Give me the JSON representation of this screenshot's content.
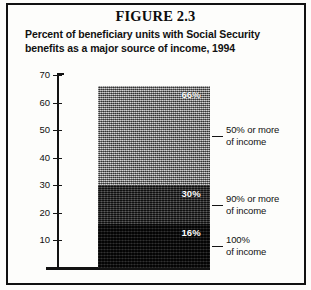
{
  "figure": {
    "number_title": "FIGURE 2.3",
    "subtitle": "Percent of beneficiary units with Social Security benefits as a major source of income, 1994"
  },
  "chart_data": {
    "type": "bar",
    "title": "Percent of beneficiary units with Social Security benefits as a major source of income, 1994",
    "xlabel": "",
    "ylabel": "",
    "ylim": [
      0,
      70
    ],
    "grid": false,
    "legend_position": "right-callouts",
    "stacked": true,
    "categories": [
      "Beneficiary units, 1994"
    ],
    "series": [
      {
        "name": "100% of income",
        "value": 16,
        "data_label": "16%",
        "fill": "darkest"
      },
      {
        "name": "90% or more of income",
        "value": 30,
        "data_label": "30%",
        "fill": "dark"
      },
      {
        "name": "50% or more of income",
        "value": 66,
        "data_label": "66%",
        "fill": "light"
      }
    ],
    "segments": [
      {
        "label": "66%",
        "top_value": 66,
        "bottom_value": 30,
        "callout": "50% or more of income"
      },
      {
        "label": "30%",
        "top_value": 30,
        "bottom_value": 16,
        "callout": "90% or more of income"
      },
      {
        "label": "16%",
        "top_value": 16,
        "bottom_value": 0,
        "callout": "100% of income"
      }
    ],
    "yticks": [
      70,
      60,
      50,
      40,
      30,
      20,
      10
    ],
    "ytick_labels": [
      "70",
      "60",
      "50",
      "40",
      "30",
      "20",
      "10"
    ]
  },
  "annotations": [
    {
      "line1": "50% or more",
      "line2": "of income"
    },
    {
      "line1": "90% or more",
      "line2": "of income"
    },
    {
      "line1": "100%",
      "line2": "of income"
    }
  ],
  "colors": {
    "ink": "#111111",
    "segment_light": "#8d8d8d",
    "segment_dark": "#1e1e1e",
    "segment_darkest": "#0c0c0c",
    "page": "#fdfdfb"
  }
}
